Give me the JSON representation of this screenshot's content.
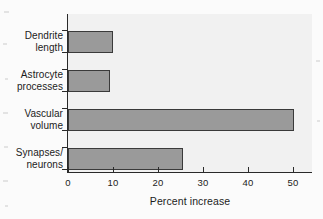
{
  "chart_data": {
    "type": "bar",
    "orientation": "horizontal",
    "title": "",
    "xlabel": "Percent increase",
    "ylabel": "",
    "categories": [
      "Dendrite length",
      "Astrocyte processes",
      "Vascular volume",
      "Synapses/ neurons"
    ],
    "category_lines": [
      [
        "Dendrite",
        "length"
      ],
      [
        "Astrocyte",
        "processes"
      ],
      [
        "Vascular",
        "volume"
      ],
      [
        "Synapses/",
        "neurons"
      ]
    ],
    "values": [
      10,
      9.3,
      50,
      25.5
    ],
    "xlim": [
      0,
      54
    ],
    "xticks": [
      0,
      10,
      20,
      30,
      40,
      50
    ],
    "xticklabels": [
      "0",
      "10",
      "20",
      "30",
      "40",
      "50"
    ],
    "grid": false,
    "legend": false,
    "bar_color": "#9a9a9a",
    "bar_edge_color": "#3a3a3a",
    "plot_background": "#f1f1f1",
    "axis_color": "#2a2a2a",
    "text_color": "#1c1c1c"
  }
}
